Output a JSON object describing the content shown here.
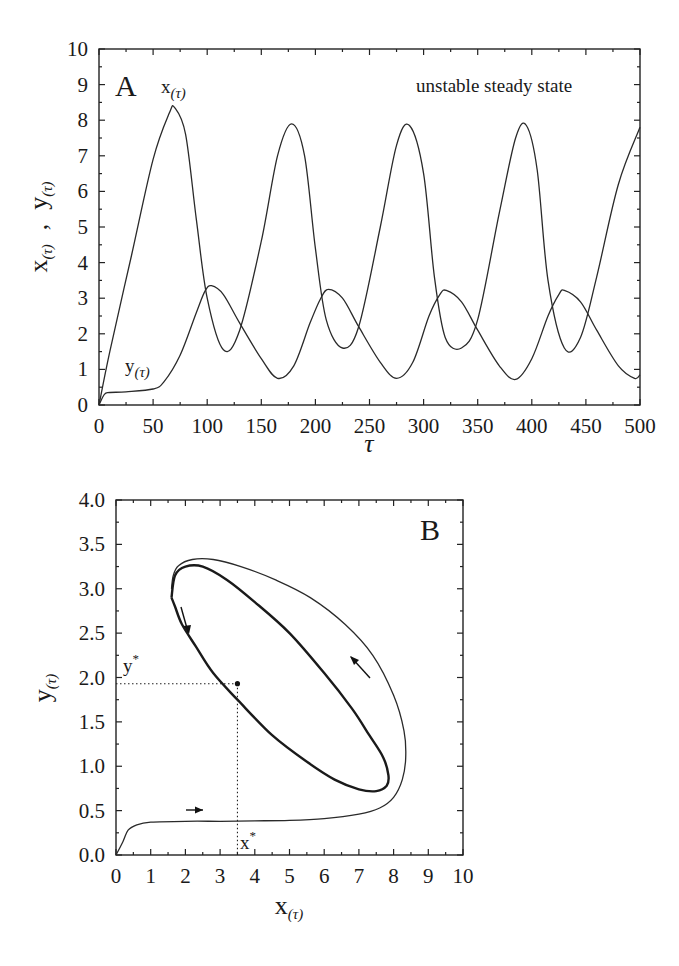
{
  "figure": {
    "panel_a": {
      "letter": "A",
      "annotation": "unstable steady state",
      "x_curve_label": "x",
      "x_curve_sub": "(τ)",
      "y_curve_label": "y",
      "y_curve_sub": "(τ)",
      "xlabel": "τ",
      "ylabel_x": "x",
      "ylabel_x_sub": "(τ)",
      "ylabel_sep": ",",
      "ylabel_y": "y",
      "ylabel_y_sub": "(τ)",
      "xticks": [
        "0",
        "50",
        "100",
        "150",
        "200",
        "250",
        "300",
        "350",
        "400",
        "450",
        "500"
      ],
      "yticks": [
        "0",
        "1",
        "2",
        "3",
        "4",
        "5",
        "6",
        "7",
        "8",
        "9",
        "10"
      ]
    },
    "panel_b": {
      "letter": "B",
      "xlabel": "x",
      "xlabel_sub": "(τ)",
      "ylabel": "y",
      "ylabel_sub": "(τ)",
      "xstar_label": "x",
      "ystar_label": "y",
      "star": "*",
      "xticks": [
        "0",
        "1",
        "2",
        "3",
        "4",
        "5",
        "6",
        "7",
        "8",
        "9",
        "10"
      ],
      "yticks": [
        "0.0",
        "0.5",
        "1.0",
        "1.5",
        "2.0",
        "2.5",
        "3.0",
        "3.5",
        "4.0"
      ]
    }
  },
  "chart_data": [
    {
      "type": "line",
      "title": "",
      "panel": "A",
      "annotation": "unstable steady state",
      "xlabel": "τ",
      "ylabel": "x(τ) , y(τ)",
      "xlim": [
        0,
        500
      ],
      "ylim": [
        0,
        10
      ],
      "grid": false,
      "series": [
        {
          "name": "x(τ)",
          "x": [
            0,
            10,
            30,
            50,
            65,
            70,
            80,
            90,
            100,
            115,
            130,
            150,
            165,
            178,
            190,
            200,
            210,
            225,
            240,
            260,
            275,
            287,
            300,
            310,
            320,
            335,
            350,
            370,
            385,
            395,
            405,
            415,
            430,
            445,
            460,
            480,
            500
          ],
          "y": [
            0,
            1.5,
            4.2,
            6.9,
            8.2,
            8.35,
            7.6,
            5.2,
            3.0,
            1.55,
            2.1,
            4.6,
            7.0,
            7.9,
            7.0,
            4.4,
            2.4,
            1.6,
            2.2,
            5.0,
            7.3,
            7.85,
            6.5,
            3.6,
            1.9,
            1.6,
            2.4,
            5.4,
            7.5,
            7.85,
            6.6,
            3.5,
            1.6,
            1.9,
            3.6,
            6.2,
            7.8
          ]
        },
        {
          "name": "y(τ)",
          "x": [
            0,
            5,
            10,
            25,
            50,
            60,
            75,
            90,
            98,
            104,
            115,
            130,
            150,
            165,
            180,
            195,
            205,
            212,
            225,
            240,
            260,
            275,
            290,
            305,
            315,
            321,
            335,
            350,
            370,
            385,
            400,
            415,
            425,
            430,
            445,
            460,
            480,
            495,
            500
          ],
          "y": [
            0,
            0.3,
            0.35,
            0.37,
            0.45,
            0.65,
            1.4,
            2.6,
            3.2,
            3.35,
            3.1,
            2.3,
            1.3,
            0.75,
            1.1,
            2.3,
            3.0,
            3.25,
            3.0,
            2.2,
            1.2,
            0.75,
            1.2,
            2.5,
            3.1,
            3.22,
            2.9,
            2.1,
            1.1,
            0.72,
            1.3,
            2.5,
            3.1,
            3.22,
            2.9,
            2.1,
            1.1,
            0.75,
            0.85
          ]
        }
      ]
    },
    {
      "type": "line",
      "title": "",
      "panel": "B",
      "xlabel": "x(τ)",
      "ylabel": "y(τ)",
      "xlim": [
        0,
        10
      ],
      "ylim": [
        0.0,
        4.0
      ],
      "grid": false,
      "steady_state": {
        "x_star": 3.5,
        "y_star": 1.93
      },
      "series": [
        {
          "name": "transient trajectory",
          "x": [
            0,
            0.2,
            0.35,
            0.6,
            1.0,
            2.0,
            3.0,
            4.0,
            5.0,
            6.0,
            7.0,
            7.6,
            8.0,
            8.25,
            8.35,
            8.3,
            8.0,
            7.4,
            6.6,
            5.6,
            4.6,
            3.6,
            2.8,
            2.2,
            1.8,
            1.65,
            1.6
          ],
          "y": [
            0.0,
            0.15,
            0.28,
            0.34,
            0.37,
            0.38,
            0.38,
            0.385,
            0.39,
            0.41,
            0.46,
            0.53,
            0.65,
            0.85,
            1.1,
            1.4,
            1.8,
            2.25,
            2.6,
            2.9,
            3.1,
            3.25,
            3.33,
            3.33,
            3.26,
            3.15,
            3.0
          ]
        },
        {
          "name": "limit cycle",
          "x": [
            1.6,
            1.7,
            2.0,
            2.5,
            3.2,
            4.0,
            5.0,
            6.0,
            6.8,
            7.3,
            7.7,
            7.85,
            7.8,
            7.5,
            7.0,
            6.3,
            5.5,
            4.5,
            3.5,
            2.8,
            2.3,
            1.9,
            1.7,
            1.6
          ],
          "y": [
            2.9,
            3.15,
            3.25,
            3.25,
            3.1,
            2.85,
            2.5,
            2.05,
            1.65,
            1.35,
            1.1,
            0.9,
            0.78,
            0.72,
            0.74,
            0.85,
            1.05,
            1.35,
            1.75,
            2.05,
            2.35,
            2.6,
            2.8,
            2.9
          ]
        }
      ]
    }
  ]
}
